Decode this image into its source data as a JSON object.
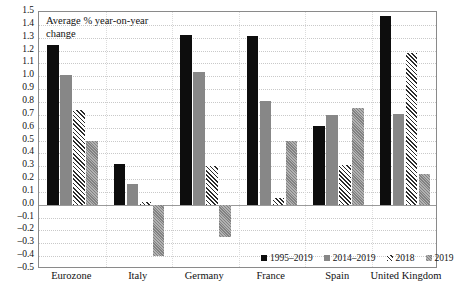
{
  "chart_data": {
    "type": "bar",
    "title": "Average % year-on-year change",
    "xlabel": "",
    "ylabel": "",
    "ylim": [
      -0.5,
      1.5
    ],
    "ytick_step": 0.1,
    "grid": true,
    "legend_position": "bottom-right-inside",
    "categories": [
      "Eurozone",
      "Italy",
      "Germany",
      "France",
      "Spain",
      "United Kingdom"
    ],
    "yticks": [
      "1.5",
      "1.4",
      "1.3",
      "1.2",
      "1.1",
      "1.0",
      "0.9",
      "0.8",
      "0.7",
      "0.6",
      "0.5",
      "0.4",
      "0.3",
      "0.2",
      "0.1",
      "0.0",
      "-0.1",
      "-0.2",
      "-0.3",
      "-0.4",
      "-0.5"
    ],
    "series": [
      {
        "name": "1995–2019",
        "fill": "solid-black",
        "values": [
          1.24,
          0.32,
          1.32,
          1.31,
          0.61,
          1.47
        ]
      },
      {
        "name": "2014–2019",
        "fill": "solid-gray",
        "values": [
          1.01,
          0.16,
          1.03,
          0.81,
          0.7,
          0.71
        ]
      },
      {
        "name": "2018",
        "fill": "hatch-diagonal",
        "values": [
          0.74,
          0.02,
          0.3,
          0.05,
          0.31,
          1.18
        ]
      },
      {
        "name": "2019",
        "fill": "textured-gray",
        "values": [
          0.5,
          -0.4,
          -0.25,
          0.5,
          0.75,
          0.24
        ]
      }
    ]
  },
  "colors": {
    "series_1995_2019": "#0d0d0d",
    "series_2014_2019": "#878787",
    "series_2018": "#2b2b2b",
    "series_2019": "#909090",
    "frame": "#8a8a8a",
    "gridline": "#c9c9c9",
    "background": "#ffffff"
  }
}
